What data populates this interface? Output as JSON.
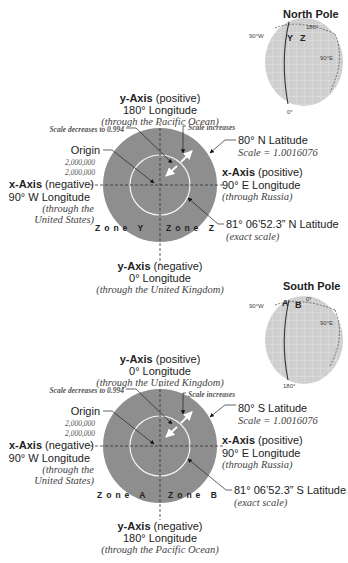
{
  "colors": {
    "disk": "#8e8e8e",
    "globe": "#cfcfcf",
    "line": "#333333",
    "exact_circle": "#ffffff"
  },
  "north": {
    "globe": {
      "title": "North Pole",
      "label_top": "180°",
      "label_left": "90°W",
      "label_right": "90°E",
      "label_bottom": "0°",
      "zone_left": "Y",
      "zone_right": "Z"
    },
    "y_pos": {
      "title_bold": "y-Axis",
      "title_rest": " (positive)",
      "longitude": "180° Longitude",
      "note": "(through the Pacific Ocean)"
    },
    "scale_decreases": "Scale decreases to 0.994",
    "scale_increases": "Scale increases",
    "origin": {
      "label": "Origin",
      "e": "2,000,000",
      "n": "2,000,000"
    },
    "x_neg": {
      "title_bold": "x-Axis",
      "title_rest": " (negative)",
      "longitude": "90° W Longitude",
      "note1": "(through the",
      "note2": "United States)"
    },
    "lat80": {
      "label": "80° N Latitude",
      "scale": "Scale = 1.0016076"
    },
    "x_pos": {
      "title_bold": "x-Axis",
      "title_rest": " (positive)",
      "longitude": "90° E Longitude",
      "note": "(through Russia)"
    },
    "exact": {
      "label": "81° 06’52.3” N Latitude",
      "note": "(exact scale)"
    },
    "zone_left": "Zone Y",
    "zone_right": "Zone Z",
    "y_neg": {
      "title_bold": "y-Axis",
      "title_rest": " (negative)",
      "longitude": "0° Longitude",
      "note": "(through the United Kingdom)"
    }
  },
  "south": {
    "globe": {
      "title": "South Pole",
      "label_top": "0°",
      "label_left": "90°W",
      "label_right": "90°E",
      "label_bottom": "180°",
      "zone_left": "A",
      "zone_right": "B"
    },
    "y_pos": {
      "title_bold": "y-Axis",
      "title_rest": " (positive)",
      "longitude": "0° Longitude",
      "note": "(through the United Kingdom)"
    },
    "scale_decreases": "Scale decreases to 0.994",
    "scale_increases": "Scale increases",
    "origin": {
      "label": "Origin",
      "e": "2,000,000",
      "n": "2,000,000"
    },
    "x_neg": {
      "title_bold": "x-Axis",
      "title_rest": " (negative)",
      "longitude": "90° W Longitude",
      "note1": "(through the",
      "note2": "United States)"
    },
    "lat80": {
      "label": "80° S Latitude",
      "scale": "Scale = 1.0016076"
    },
    "x_pos": {
      "title_bold": "x-Axis",
      "title_rest": " (positive)",
      "longitude": "90° E Longitude",
      "note": "(through Russia)"
    },
    "exact": {
      "label": "81° 06’52.3” S Latitude",
      "note": "(exact scale)"
    },
    "zone_left": "Zone A",
    "zone_right": "Zone B",
    "y_neg": {
      "title_bold": "y-Axis",
      "title_rest": " (negative)",
      "longitude": "180° Longitude",
      "note": "(through the Pacific Ocean)"
    }
  }
}
